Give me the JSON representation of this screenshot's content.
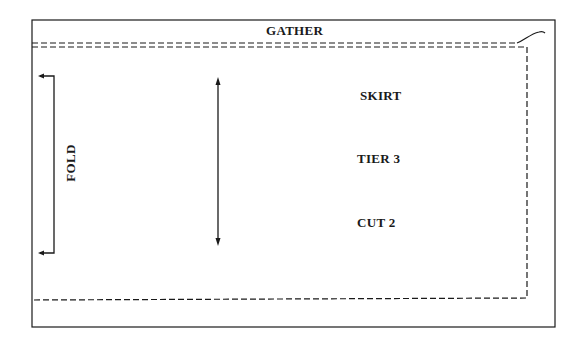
{
  "pattern_piece": {
    "gather_label": "GATHER",
    "fold_label": "FOLD",
    "piece_name": "SKIRT",
    "tier_label": "TIER 3",
    "cut_label": "CUT 2"
  },
  "colors": {
    "line": "#1a1a1a",
    "background": "#ffffff"
  },
  "icons": {
    "grainline": "double-headed-vertical-arrow",
    "fold": "fold-bracket-arrows"
  }
}
